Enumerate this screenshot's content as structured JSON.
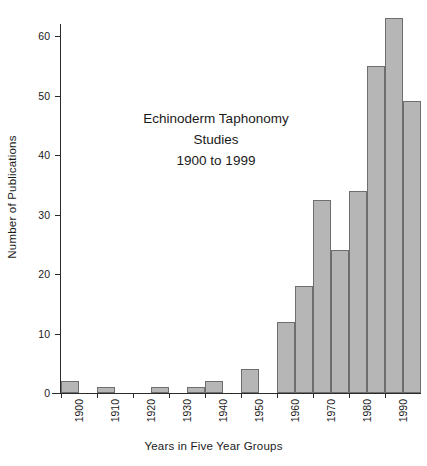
{
  "chart_data": {
    "type": "bar",
    "title_lines": [
      "Echinoderm Taphonomy",
      "Studies",
      "1900 to 1999"
    ],
    "xlabel": "Years in Five Year Groups",
    "ylabel": "Number of Publications",
    "categories": [
      "1900",
      "1905",
      "1910",
      "1915",
      "1920",
      "1925",
      "1930",
      "1935",
      "1940",
      "1945",
      "1950",
      "1955",
      "1960",
      "1965",
      "1970",
      "1975",
      "1980",
      "1985",
      "1990",
      "1995"
    ],
    "values": [
      2,
      0,
      1,
      0,
      0,
      1,
      0,
      1,
      2,
      0,
      4,
      0,
      12,
      18,
      32.5,
      24,
      34,
      55,
      63,
      49
    ],
    "ylim": [
      0,
      66
    ],
    "yticks": [
      0,
      10,
      20,
      30,
      40,
      50,
      60
    ],
    "ytick_labels": [
      "0",
      "10",
      "20",
      "30",
      "40",
      "50",
      "60"
    ],
    "xtick_labels": [
      "1900",
      "1910",
      "1920",
      "1930",
      "1940",
      "1950",
      "1960",
      "1970",
      "1980",
      "1990"
    ],
    "xtick_categories": [
      "1900",
      "1910",
      "1920",
      "1930",
      "1940",
      "1950",
      "1960",
      "1970",
      "1980",
      "1990"
    ],
    "grid": false,
    "legend": null,
    "bar_fill_color": "#b6b6b6",
    "bar_edge_color": "#6e6e6e",
    "axis_color": "#2b2b2b"
  }
}
